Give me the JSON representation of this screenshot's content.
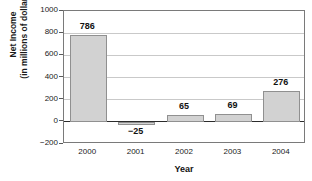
{
  "chart_data": {
    "type": "bar",
    "title": "",
    "xlabel": "Year",
    "ylabel_line1": "Net Income",
    "ylabel_line2": "(in millions of dollars)",
    "categories": [
      "2000",
      "2001",
      "2002",
      "2003",
      "2004"
    ],
    "values": [
      786,
      -25,
      65,
      69,
      276
    ],
    "value_labels": [
      "786",
      "−25",
      "65",
      "69",
      "276"
    ],
    "ylim": [
      -200,
      1000
    ],
    "yticks": [
      1000,
      800,
      600,
      400,
      200,
      0,
      -200
    ],
    "ytick_labels": [
      "1000",
      "800",
      "600",
      "400",
      "200",
      "0",
      "−200"
    ],
    "grid": true,
    "legend": false,
    "bar_color": "#d2d2d2",
    "bar_border_color": "#909090",
    "axis_color": "#7a7a7a",
    "grid_color": "#c9c9c9",
    "zero_line_color": "#2b2b2b",
    "text_color": "#1a1a1a"
  }
}
